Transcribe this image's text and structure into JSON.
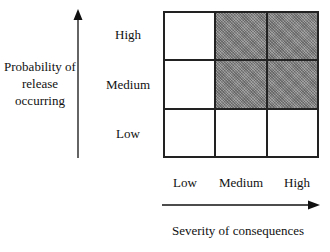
{
  "y_axis": {
    "label": "Probability of release occurring",
    "ticks": [
      "High",
      "Medium",
      "Low"
    ]
  },
  "x_axis": {
    "label": "Severity of consequences",
    "ticks": [
      "Low",
      "Medium",
      "High"
    ]
  },
  "matrix": {
    "rows": [
      "High",
      "Medium",
      "Low"
    ],
    "cols": [
      "Low",
      "Medium",
      "High"
    ],
    "shaded": [
      [
        false,
        true,
        true
      ],
      [
        false,
        true,
        true
      ],
      [
        false,
        false,
        false
      ]
    ],
    "shade_color": "#8a8a8a"
  }
}
